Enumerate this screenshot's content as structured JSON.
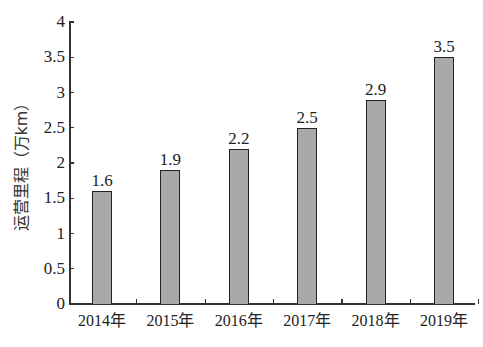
{
  "chart_data": {
    "type": "bar",
    "title": "",
    "xlabel": "",
    "ylabel": "运营里程（万km）",
    "categories": [
      "2014年",
      "2015年",
      "2016年",
      "2017年",
      "2018年",
      "2019年"
    ],
    "values": [
      1.6,
      1.9,
      2.2,
      2.5,
      2.9,
      3.5
    ],
    "value_labels": [
      "1.6",
      "1.9",
      "2.2",
      "2.5",
      "2.9",
      "3.5"
    ],
    "ylim": [
      0,
      4
    ],
    "yticks": [
      "0",
      "0.5",
      "1",
      "1.5",
      "2",
      "2.5",
      "3",
      "3.5",
      "4"
    ],
    "grid": false,
    "legend": null,
    "bar_color": "#a9a9a9"
  }
}
